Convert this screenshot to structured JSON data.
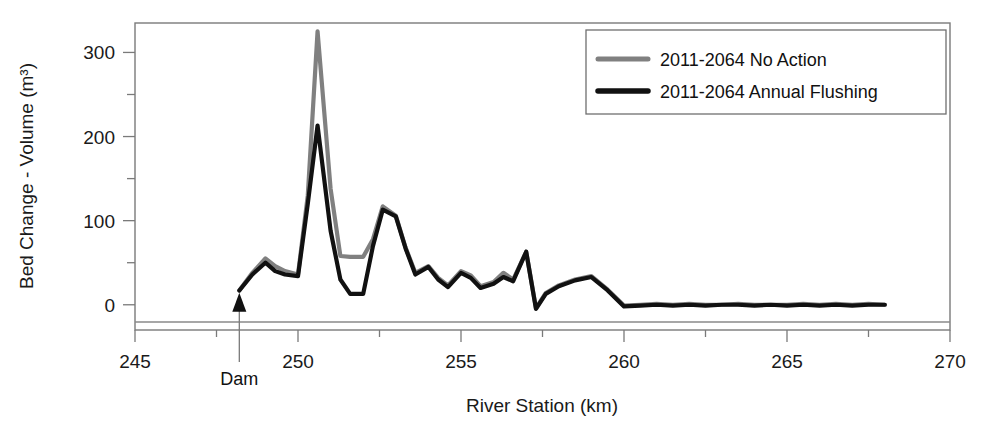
{
  "chart_data": {
    "type": "line",
    "title": "",
    "xlabel": "River Station (km)",
    "ylabel": "Bed Change - Volume (m³)",
    "xlim": [
      245,
      270
    ],
    "ylim": [
      -30,
      335
    ],
    "xticks": [
      245,
      250,
      255,
      260,
      265,
      270
    ],
    "xtick_labels": [
      "245",
      "250",
      "255",
      "260",
      "265",
      "270"
    ],
    "yticks": [
      0,
      100,
      200,
      300
    ],
    "ytick_labels": [
      "0",
      "100",
      "200",
      "300"
    ],
    "yminorticks": [
      50,
      150,
      250
    ],
    "grid": false,
    "legend_position": "top-right",
    "annotations": [
      {
        "name": "dam-arrow",
        "label": "Dam",
        "x": 248.2,
        "y": 0
      }
    ],
    "series": [
      {
        "name": "2011-2064 No Action",
        "color": "#808080",
        "linewidth": 4.2,
        "x": [
          248.2,
          248.6,
          249.0,
          249.3,
          249.6,
          250.0,
          250.3,
          250.6,
          251.0,
          251.3,
          251.6,
          252.0,
          252.3,
          252.6,
          253.0,
          253.3,
          253.6,
          254.0,
          254.3,
          254.6,
          255.0,
          255.3,
          255.6,
          256.0,
          256.3,
          256.6,
          257.0,
          257.3,
          257.6,
          258.0,
          258.5,
          259.0,
          259.5,
          260.0,
          260.5,
          261.0,
          261.5,
          262.0,
          262.5,
          263.0,
          263.5,
          264.0,
          264.5,
          265.0,
          265.5,
          266.0,
          266.5,
          267.0,
          267.5,
          268.0
        ],
        "y": [
          17,
          38,
          55,
          46,
          40,
          36,
          130,
          325,
          138,
          58,
          57,
          57,
          78,
          117,
          106,
          68,
          38,
          46,
          32,
          23,
          40,
          35,
          22,
          27,
          38,
          30,
          63,
          -4,
          14,
          23,
          30,
          34,
          18,
          -1,
          0,
          1,
          0,
          1,
          0,
          0,
          1,
          0,
          0,
          0,
          1,
          0,
          1,
          0,
          1,
          0
        ]
      },
      {
        "name": "2011-2064 Annual Flushing",
        "color": "#111111",
        "linewidth": 4.2,
        "x": [
          248.2,
          248.6,
          249.0,
          249.3,
          249.6,
          250.0,
          250.3,
          250.6,
          251.0,
          251.3,
          251.6,
          252.0,
          252.3,
          252.6,
          253.0,
          253.3,
          253.6,
          254.0,
          254.3,
          254.6,
          255.0,
          255.3,
          255.6,
          256.0,
          256.3,
          256.6,
          257.0,
          257.3,
          257.6,
          258.0,
          258.5,
          259.0,
          259.5,
          260.0,
          260.5,
          261.0,
          261.5,
          262.0,
          262.5,
          263.0,
          263.5,
          264.0,
          264.5,
          265.0,
          265.5,
          266.0,
          266.5,
          267.0,
          267.5,
          268.0
        ],
        "y": [
          17,
          36,
          50,
          40,
          36,
          34,
          120,
          213,
          88,
          30,
          13,
          13,
          70,
          113,
          105,
          67,
          36,
          45,
          30,
          21,
          38,
          32,
          20,
          25,
          33,
          28,
          63,
          -5,
          13,
          22,
          29,
          33,
          17,
          -2,
          -1,
          0,
          -1,
          0,
          -1,
          0,
          0,
          -1,
          0,
          -1,
          0,
          -1,
          0,
          -1,
          0,
          0
        ]
      }
    ]
  },
  "legend": {
    "entries": [
      {
        "label": "2011-2064 No Action",
        "color": "#808080"
      },
      {
        "label": "2011-2064 Annual Flushing",
        "color": "#111111"
      }
    ]
  }
}
